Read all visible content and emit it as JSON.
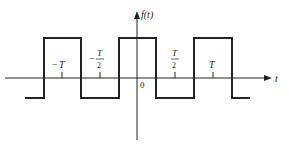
{
  "diagram": {
    "type": "square-wave",
    "y_axis_label": "f(t)",
    "x_axis_label": "t",
    "origin_label": "0",
    "ticks": [
      {
        "id": "neg-T",
        "sign": "−",
        "num": "T",
        "den": "",
        "x": 62
      },
      {
        "id": "neg-T-half",
        "sign": "−",
        "num": "T",
        "den": "2",
        "x": 100
      },
      {
        "id": "T-half",
        "sign": "",
        "num": "T",
        "den": "2",
        "x": 175
      },
      {
        "id": "T",
        "sign": "",
        "num": "T",
        "den": "",
        "x": 213
      }
    ],
    "colors": {
      "line": "#222222",
      "background": "#ffffff"
    }
  }
}
